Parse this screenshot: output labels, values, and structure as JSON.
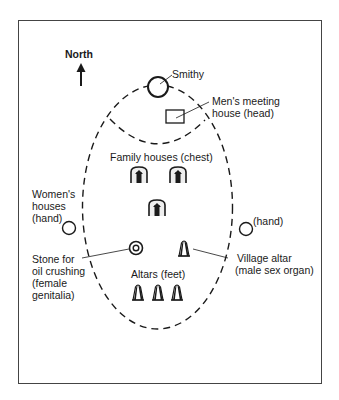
{
  "diagram": {
    "type": "village-layout-body-analogy",
    "compass": {
      "label": "North",
      "direction": "up"
    },
    "labels": {
      "north": "North",
      "smithy": "Smithy",
      "mens_house_line1": "Men's meeting",
      "mens_house_line2": "house (head)",
      "family_houses": "Family houses (chest)",
      "womens_line1": "Women's",
      "womens_line2": "houses",
      "womens_line3": "(hand)",
      "right_hand": "(hand)",
      "stone_line1": "Stone for",
      "stone_line2": "oil crushing",
      "stone_line3": "(female",
      "stone_line4": "genitalia)",
      "village_altar_line1": "Village altar",
      "village_altar_line2": "(male sex organ)",
      "altars": "Altars (feet)"
    },
    "elements": [
      {
        "id": "smithy",
        "shape": "circle",
        "label": "Smithy"
      },
      {
        "id": "mens-meeting-house",
        "shape": "rectangle",
        "label": "Men's meeting house (head)"
      },
      {
        "id": "family-house-1",
        "shape": "house-icon",
        "label": "Family houses (chest)"
      },
      {
        "id": "family-house-2",
        "shape": "house-icon",
        "label": "Family houses (chest)"
      },
      {
        "id": "family-house-3",
        "shape": "house-icon",
        "label": "Family houses (chest)"
      },
      {
        "id": "womens-houses",
        "shape": "circle",
        "label": "Women's houses (hand)"
      },
      {
        "id": "right-hand",
        "shape": "circle",
        "label": "(hand)"
      },
      {
        "id": "oil-stone",
        "shape": "double-circle",
        "label": "Stone for oil crushing (female genitalia)"
      },
      {
        "id": "village-altar",
        "shape": "altar",
        "label": "Village altar (male sex organ)"
      },
      {
        "id": "altar-1",
        "shape": "altar",
        "label": "Altars (feet)"
      },
      {
        "id": "altar-2",
        "shape": "altar",
        "label": "Altars (feet)"
      },
      {
        "id": "altar-3",
        "shape": "altar",
        "label": "Altars (feet)"
      }
    ],
    "boundaries": [
      {
        "id": "village-outline",
        "shape": "dashed-ellipse"
      },
      {
        "id": "head-arc",
        "shape": "dashed-arc"
      }
    ],
    "colors": {
      "ink": "#1a1a1a",
      "frame": "#444444",
      "background": "#ffffff"
    }
  }
}
